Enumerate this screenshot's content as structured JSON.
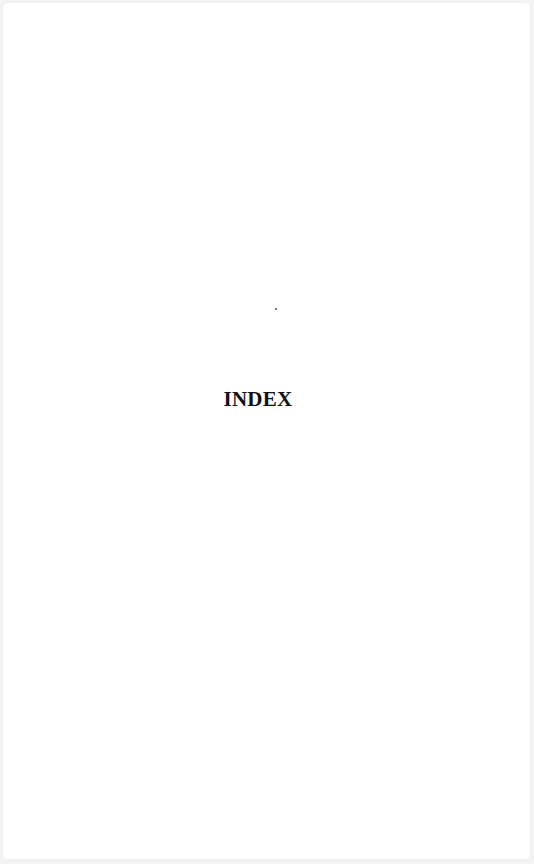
{
  "page": {
    "heading": "INDEX",
    "background_color": "#ffffff",
    "text_color": "#111111"
  }
}
